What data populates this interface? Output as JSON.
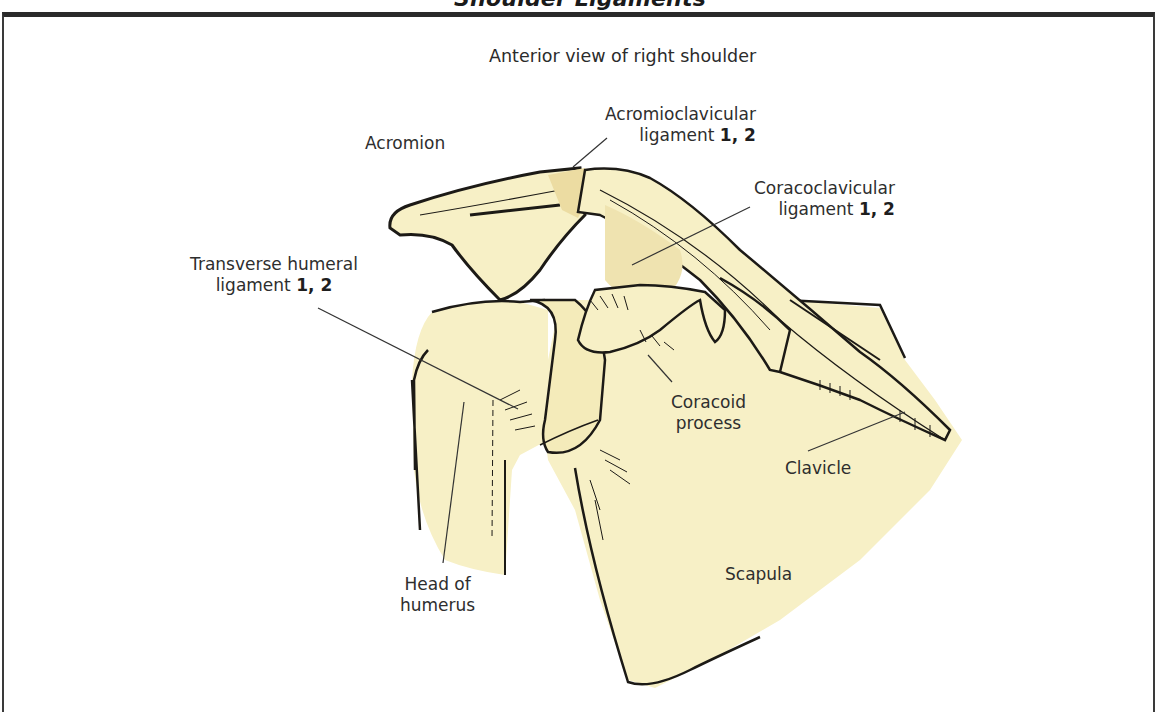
{
  "figure": {
    "title": "Shoulder Ligaments",
    "subtitle": "Anterior view of right shoulder",
    "colors": {
      "bone_fill": "#f7f0c6",
      "ligament_fill": "#efe3b0",
      "outline": "#1c1a16",
      "leader_line": "#333333",
      "frame": "#2a2a2a",
      "background": "#ffffff"
    }
  },
  "labels": {
    "acromion": {
      "text": "Acromion"
    },
    "acromioclavicular": {
      "line1": "Acromioclavicular",
      "line2": "ligament",
      "refs": "1, 2"
    },
    "coracoclavicular": {
      "line1": "Coracoclavicular",
      "line2": "ligament",
      "refs": "1, 2"
    },
    "transverse_humeral": {
      "line1": "Transverse humeral",
      "line2": "ligament",
      "refs": "1, 2"
    },
    "coracoid_process": {
      "line1": "Coracoid",
      "line2": "process"
    },
    "clavicle": {
      "text": "Clavicle"
    },
    "head_of_humerus": {
      "line1": "Head of",
      "line2": "humerus"
    },
    "scapula": {
      "text": "Scapula"
    }
  }
}
